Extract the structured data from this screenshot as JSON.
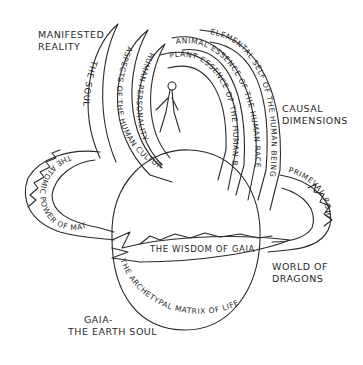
{
  "diagram": {
    "labels": {
      "manifested_reality_1": "MANIFESTED",
      "manifested_reality_2": "REALITY",
      "causal_dimensions_1": "CAUSAL",
      "causal_dimensions_2": "DIMENSIONS",
      "world_of_dragons_1": "WORLD OF",
      "world_of_dragons_2": "DRAGONS",
      "gaia_1": "GAIA-",
      "gaia_2": "THE EARTH SOUL"
    },
    "bands": {
      "the_soul": "THE SOUL",
      "aspects_human_culture": "ASPECTS OF THE HUMAN CULTURE",
      "human_personality": "HUMAN PERSONALITY",
      "plant_essence": "PLANT ESSENCE OF THE HUMAN BEING",
      "animal_essence": "ANIMAL ESSENCE OF THE HUMAN RACE",
      "elemental_self": "ELEMENTAL SELF OF THE HUMAN BEING",
      "atomic_power": "THE ATOMIC POWER OF MATTER",
      "primeval_powers": "PRIMEVAL POWERS OF GAIA",
      "wisdom_of_gaia": "THE WISDOM OF GAIA",
      "archetypal_matrix": "THE ARCHETYPAL MATRIX OF LIFE"
    },
    "figure": "walking-human-figure",
    "colors": {
      "ink": "#2a2a2a",
      "background": "#ffffff"
    }
  }
}
